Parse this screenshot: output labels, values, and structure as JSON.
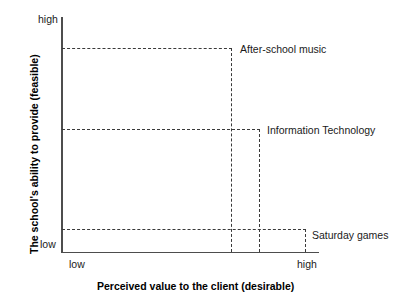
{
  "chart_data": {
    "type": "scatter",
    "title": "",
    "subtitle": "",
    "xlabel": "Perceived value to the client (desirable)",
    "ylabel": "The school's ability to provide (feasible)",
    "xlim": [
      "low",
      "high"
    ],
    "ylim": [
      "low",
      "high"
    ],
    "x_tick_labels": [
      "low",
      "high"
    ],
    "y_tick_labels": [
      "low",
      "high"
    ],
    "grid": false,
    "legend": "none",
    "annotations": "Each item is located by dashed leader lines dropped to both axes",
    "points": [
      {
        "label": "After-school music",
        "x": 0.66,
        "y": 0.87,
        "x_qualitative": "medium-high",
        "y_qualitative": "high"
      },
      {
        "label": "Information Technology",
        "x": 0.77,
        "y": 0.52,
        "x_qualitative": "high",
        "y_qualitative": "medium"
      },
      {
        "label": "Saturday games",
        "x": 0.95,
        "y": 0.1,
        "x_qualitative": "high",
        "y_qualitative": "low"
      }
    ]
  },
  "axes": {
    "y": {
      "title": "The school's ability to provide (feasible)",
      "tick_high": "high",
      "tick_low": "low"
    },
    "x": {
      "title": "Perceived value to the client (desirable)",
      "tick_low": "low",
      "tick_high": "high"
    }
  },
  "labels": {
    "afterschool": "After-school music",
    "it": "Information Technology",
    "saturday": "Saturday games"
  },
  "colors": {
    "axis": "#4d4d4d",
    "leader_line": "#3a3a3a",
    "text": "#1a1a1a",
    "background": "#ffffff"
  }
}
